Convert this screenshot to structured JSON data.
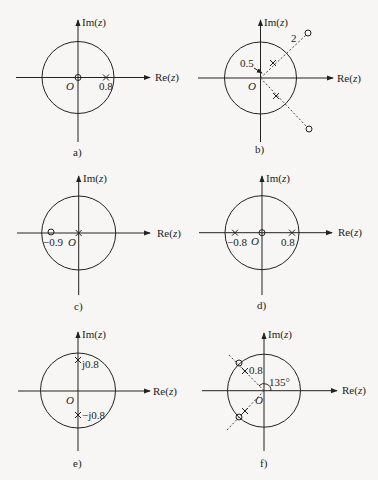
{
  "axis_labels": {
    "re": "Re(z)",
    "im": "Im(z)",
    "origin": "O"
  },
  "panels": [
    {
      "id": "a",
      "caption": "a)",
      "labels": {
        "pole": "0.8"
      },
      "zeros": [
        [
          0,
          0
        ]
      ],
      "poles": [
        [
          0.8,
          0
        ]
      ]
    },
    {
      "id": "b",
      "caption": "b)",
      "labels": {
        "radius_pole": "0.5",
        "radius_zero": "2"
      },
      "zeros": [
        "2∠45°",
        "2∠-45°"
      ],
      "poles": [
        "0.5∠45°",
        "0.5∠-45°"
      ]
    },
    {
      "id": "c",
      "caption": "c)",
      "labels": {
        "zero": "−0.9"
      },
      "zeros": [
        [
          -0.9,
          0
        ]
      ],
      "poles": [
        [
          0,
          0
        ]
      ]
    },
    {
      "id": "d",
      "caption": "d)",
      "labels": {
        "pole_neg": "−0.8",
        "pole_pos": "0.8"
      },
      "zeros": [
        [
          0,
          0
        ]
      ],
      "poles": [
        [
          -0.8,
          0
        ],
        [
          0.8,
          0
        ]
      ]
    },
    {
      "id": "e",
      "caption": "e)",
      "labels": {
        "pole_up": "j0.8",
        "pole_down": "−j0.8"
      },
      "zeros": [],
      "poles": [
        [
          0,
          0.8
        ],
        [
          0,
          -0.8
        ]
      ]
    },
    {
      "id": "f",
      "caption": "f)",
      "labels": {
        "pole": "0.8",
        "angle": "135°"
      },
      "zeros": [
        "1∠135°",
        "1∠-135°"
      ],
      "poles": [
        "0.8∠135°",
        "0.8∠-135°"
      ]
    }
  ]
}
